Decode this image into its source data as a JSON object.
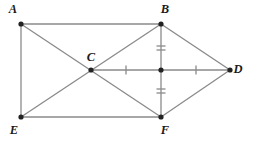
{
  "figure": {
    "title": "Geometric figure ABDFE with congruence tick marks",
    "width": 254,
    "height": 145,
    "background_color": "#ffffff",
    "stroke_color": "#8a8a8a",
    "vertex_color": "#222222",
    "label_color": "#1a1a1a"
  },
  "points": [
    {
      "id": "A",
      "label": "A",
      "x": 21,
      "y": 24,
      "label_x": 13,
      "label_y": 10,
      "labeled": true
    },
    {
      "id": "B",
      "label": "B",
      "x": 161,
      "y": 24,
      "label_x": 165,
      "label_y": 10,
      "labeled": true
    },
    {
      "id": "C",
      "label": "C",
      "x": 91,
      "y": 70,
      "label_x": 91,
      "label_y": 58,
      "labeled": true
    },
    {
      "id": "D",
      "label": "D",
      "x": 230,
      "y": 70,
      "label_x": 238,
      "label_y": 70,
      "labeled": true
    },
    {
      "id": "E",
      "label": "E",
      "x": 21,
      "y": 117,
      "label_x": 14,
      "label_y": 131,
      "labeled": true
    },
    {
      "id": "F",
      "label": "F",
      "x": 161,
      "y": 117,
      "label_x": 165,
      "label_y": 131,
      "labeled": true
    },
    {
      "id": "M",
      "label": "",
      "x": 161,
      "y": 70,
      "label_x": 0,
      "label_y": 0,
      "labeled": false
    }
  ],
  "segments": [
    {
      "name": "segment-A-B",
      "from": "A",
      "to": "B"
    },
    {
      "name": "segment-A-E",
      "from": "A",
      "to": "E"
    },
    {
      "name": "segment-E-F",
      "from": "E",
      "to": "F"
    },
    {
      "name": "segment-B-F",
      "from": "B",
      "to": "F"
    },
    {
      "name": "segment-A-F",
      "from": "A",
      "to": "F"
    },
    {
      "name": "segment-B-E",
      "from": "B",
      "to": "E"
    },
    {
      "name": "segment-C-D",
      "from": "C",
      "to": "D"
    },
    {
      "name": "segment-B-D",
      "from": "B",
      "to": "D"
    },
    {
      "name": "segment-F-D",
      "from": "F",
      "to": "D"
    }
  ],
  "tick_marks": [
    {
      "name": "tick-B-to-midpoint",
      "on_segment": "segment-B-M",
      "count": 2,
      "x": 161,
      "y": 48,
      "orientation": "horizontal",
      "length": 9,
      "gap": 4
    },
    {
      "name": "tick-midpoint-to-F",
      "on_segment": "segment-M-F",
      "count": 2,
      "x": 161,
      "y": 91,
      "orientation": "horizontal",
      "length": 9,
      "gap": 4
    },
    {
      "name": "tick-C-to-midpoint",
      "on_segment": "segment-C-M",
      "count": 1,
      "x": 126,
      "y": 70,
      "orientation": "vertical",
      "length": 9,
      "gap": 0
    },
    {
      "name": "tick-midpoint-to-D",
      "on_segment": "segment-M-D",
      "count": 1,
      "x": 196,
      "y": 70,
      "orientation": "vertical",
      "length": 9,
      "gap": 0
    }
  ],
  "vertex_dot_radius": 2.6
}
